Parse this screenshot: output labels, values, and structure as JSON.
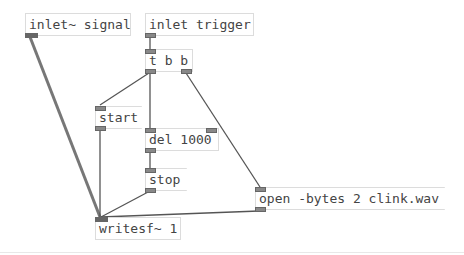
{
  "patch": {
    "objects": [
      {
        "id": "inlet_signal",
        "type": "object",
        "text": "inlet~ signal"
      },
      {
        "id": "inlet_trigger",
        "type": "object",
        "text": "inlet trigger"
      },
      {
        "id": "t_b_b",
        "type": "object",
        "text": "t b b"
      },
      {
        "id": "start_msg",
        "type": "message",
        "text": "start"
      },
      {
        "id": "del_1000",
        "type": "object",
        "text": "del 1000"
      },
      {
        "id": "stop_msg",
        "type": "message",
        "text": "stop"
      },
      {
        "id": "open_msg",
        "type": "message",
        "text": "open -bytes 2 clink.wav"
      },
      {
        "id": "writesf",
        "type": "object",
        "text": "writesf~ 1"
      }
    ],
    "connections": [
      {
        "from": "inlet_trigger",
        "to": "t_b_b"
      },
      {
        "from": "t_b_b:0",
        "to": "start_msg"
      },
      {
        "from": "t_b_b:0",
        "to": "del_1000"
      },
      {
        "from": "t_b_b:1",
        "to": "open_msg"
      },
      {
        "from": "del_1000",
        "to": "stop_msg"
      },
      {
        "from": "start_msg",
        "to": "writesf"
      },
      {
        "from": "stop_msg",
        "to": "writesf"
      },
      {
        "from": "open_msg",
        "to": "writesf"
      },
      {
        "from": "inlet_signal",
        "to": "writesf",
        "signal": true
      }
    ],
    "colors": {
      "wire": "#555555",
      "signal_wire": "#777777",
      "box_border": "#dcdcdc",
      "text": "#444444"
    }
  }
}
